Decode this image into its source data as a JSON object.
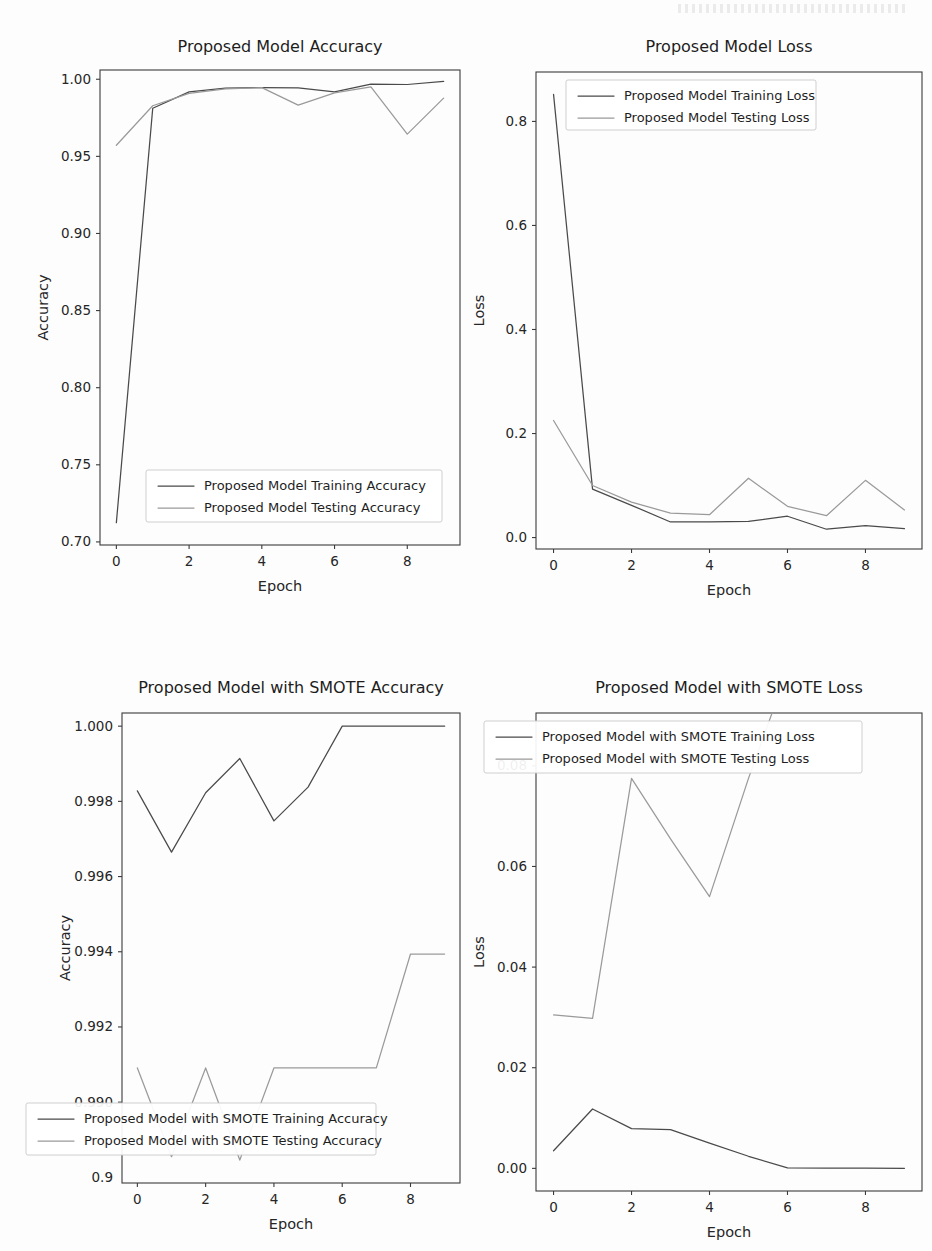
{
  "page": {
    "background_color": "#fdfdfd",
    "train_color": "#4a4a4a",
    "test_color": "#9a9a9a"
  },
  "charts": [
    {
      "id": "proposed-model-accuracy",
      "title": "Proposed Model Accuracy",
      "xlabel": "Epoch",
      "ylabel": "Accuracy",
      "legend_position": "lower-center",
      "grid": false,
      "chart_data": {
        "type": "line",
        "title": "Proposed Model Accuracy",
        "xlabel": "Epoch",
        "ylabel": "Accuracy",
        "x": [
          0,
          1,
          2,
          3,
          4,
          5,
          6,
          7,
          8,
          9
        ],
        "xlim": [
          -0.45,
          9.45
        ],
        "ylim": [
          0.698,
          1.006
        ],
        "xticks": [
          0,
          2,
          4,
          6,
          8
        ],
        "xticklabels": [
          "0",
          "2",
          "4",
          "6",
          "8"
        ],
        "yticks": [
          0.7,
          0.75,
          0.8,
          0.85,
          0.9,
          0.95,
          1.0
        ],
        "yticklabels": [
          "0.70",
          "0.75",
          "0.80",
          "0.85",
          "0.90",
          "0.95",
          "1.00"
        ],
        "series": [
          {
            "name": "Proposed Model Training Accuracy",
            "color": "#4a4a4a",
            "values": [
              0.7125,
              0.9812,
              0.9918,
              0.9942,
              0.9946,
              0.9944,
              0.9918,
              0.9968,
              0.9966,
              0.9986
            ]
          },
          {
            "name": "Proposed Model Testing Accuracy",
            "color": "#9a9a9a",
            "values": [
              0.9572,
              0.9828,
              0.9908,
              0.9938,
              0.9946,
              0.9832,
              0.9912,
              0.995,
              0.9644,
              0.9878
            ]
          }
        ]
      }
    },
    {
      "id": "proposed-model-loss",
      "title": "Proposed Model Loss",
      "xlabel": "Epoch",
      "ylabel": "Loss",
      "legend_position": "upper-center",
      "grid": false,
      "chart_data": {
        "type": "line",
        "title": "Proposed Model Loss",
        "xlabel": "Epoch",
        "ylabel": "Loss",
        "x": [
          0,
          1,
          2,
          3,
          4,
          5,
          6,
          7,
          8,
          9
        ],
        "xlim": [
          -0.45,
          9.45
        ],
        "ylim": [
          -0.022,
          0.895
        ],
        "xticks": [
          0,
          2,
          4,
          6,
          8
        ],
        "xticklabels": [
          "0",
          "2",
          "4",
          "6",
          "8"
        ],
        "yticks": [
          0.0,
          0.2,
          0.4,
          0.6,
          0.8
        ],
        "yticklabels": [
          "0.0",
          "0.2",
          "0.4",
          "0.6",
          "0.8"
        ],
        "series": [
          {
            "name": "Proposed Model Training Loss",
            "color": "#4a4a4a",
            "values": [
              0.852,
              0.093,
              0.062,
              0.03,
              0.03,
              0.031,
              0.041,
              0.016,
              0.023,
              0.017
            ]
          },
          {
            "name": "Proposed Model Testing Loss",
            "color": "#9a9a9a",
            "values": [
              0.225,
              0.1,
              0.068,
              0.047,
              0.044,
              0.114,
              0.06,
              0.042,
              0.11,
              0.053
            ]
          }
        ]
      }
    },
    {
      "id": "proposed-model-smote-accuracy",
      "title": "Proposed Model with SMOTE Accuracy",
      "xlabel": "Epoch",
      "ylabel": "Accuracy",
      "legend_position": "lower-left",
      "grid": false,
      "chart_data": {
        "type": "line",
        "title": "Proposed Model with SMOTE Accuracy",
        "xlabel": "Epoch",
        "ylabel": "Accuracy",
        "x": [
          0,
          1,
          2,
          3,
          4,
          5,
          6,
          7,
          8,
          9
        ],
        "xlim": [
          -0.45,
          9.45
        ],
        "ylim": [
          0.98785,
          1.00035
        ],
        "xticks": [
          0,
          2,
          4,
          6,
          8
        ],
        "xticklabels": [
          "0",
          "2",
          "4",
          "6",
          "8"
        ],
        "yticks": [
          0.99,
          0.992,
          0.994,
          0.996,
          0.998,
          1.0
        ],
        "yticklabels": [
          "0.990",
          "0.992",
          "0.994",
          "0.996",
          "0.998",
          "1.000"
        ],
        "extra_yticklabel": "0.9",
        "series": [
          {
            "name": "Proposed Model with SMOTE Training Accuracy",
            "color": "#4a4a4a",
            "values": [
              0.99828,
              0.99665,
              0.99823,
              0.99914,
              0.99748,
              0.99838,
              1.0,
              1.0,
              1.0,
              1.0
            ]
          },
          {
            "name": "Proposed Model with SMOTE Testing Accuracy",
            "color": "#9a9a9a",
            "values": [
              0.99091,
              0.98855,
              0.99091,
              0.98846,
              0.99091,
              0.99091,
              0.99091,
              0.99091,
              0.99394,
              0.99394
            ]
          }
        ]
      }
    },
    {
      "id": "proposed-model-smote-loss",
      "title": "Proposed Model with SMOTE Loss",
      "xlabel": "Epoch",
      "ylabel": "Loss",
      "legend_position": "upper-center",
      "grid": false,
      "chart_data": {
        "type": "line",
        "title": "Proposed Model with SMOTE Loss",
        "xlabel": "Epoch",
        "ylabel": "Loss",
        "x": [
          0,
          1,
          2,
          3,
          4,
          5,
          6,
          7,
          8,
          9
        ],
        "xlim": [
          -0.45,
          9.45
        ],
        "ylim": [
          -0.0045,
          0.0905
        ],
        "xticks": [
          0,
          2,
          4,
          6,
          8
        ],
        "xticklabels": [
          "0",
          "2",
          "4",
          "6",
          "8"
        ],
        "yticks": [
          0.0,
          0.02,
          0.04,
          0.06,
          0.08
        ],
        "yticklabels": [
          "0.00",
          "0.02",
          "0.04",
          "0.06",
          "0.08"
        ],
        "series": [
          {
            "name": "Proposed Model with SMOTE Training Loss",
            "color": "#4a4a4a",
            "values": [
              0.0035,
              0.0118,
              0.0079,
              0.0077,
              0.005,
              0.0024,
              8e-05,
              4e-05,
              3e-05,
              2e-05
            ]
          },
          {
            "name": "Proposed Model with SMOTE Testing Loss",
            "color": "#9a9a9a",
            "values": [
              0.0305,
              0.0298,
              0.0775,
              0.0655,
              0.054,
              0.0775,
              0.099,
              0.099,
              0.099,
              0.099
            ]
          }
        ]
      }
    }
  ]
}
